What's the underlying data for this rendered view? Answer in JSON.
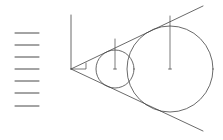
{
  "diagram": {
    "title": "",
    "stroke_color": "#444444",
    "arrow_color": "#333333",
    "arrows": [
      {
        "x1": 15,
        "x2": 39,
        "y": 33
      },
      {
        "x1": 15,
        "x2": 39,
        "y": 45
      },
      {
        "x1": 15,
        "x2": 39,
        "y": 57
      },
      {
        "x1": 15,
        "x2": 39,
        "y": 69
      },
      {
        "x1": 15,
        "x2": 39,
        "y": 81
      },
      {
        "x1": 15,
        "x2": 39,
        "y": 93
      },
      {
        "x1": 15,
        "x2": 39,
        "y": 106
      }
    ],
    "vertex": {
      "x": 71,
      "y": 69
    },
    "vertical_axis": {
      "x": 71,
      "y1": 15,
      "y2": 69
    },
    "upper_tangent": {
      "x1": 71,
      "y1": 69,
      "x2": 203,
      "y2": 6
    },
    "lower_tangent": {
      "x1": 71,
      "y1": 69,
      "x2": 203,
      "y2": 131
    },
    "angle_marker": {
      "x": 86,
      "y_top": 63,
      "y_bottom": 69
    },
    "circles": [
      {
        "name": "small-circle",
        "cx": 115,
        "cy": 69,
        "r": 19,
        "marker_top": 39
      },
      {
        "name": "large-circle",
        "cx": 170,
        "cy": 69,
        "r": 43,
        "marker_top": 16
      }
    ]
  }
}
